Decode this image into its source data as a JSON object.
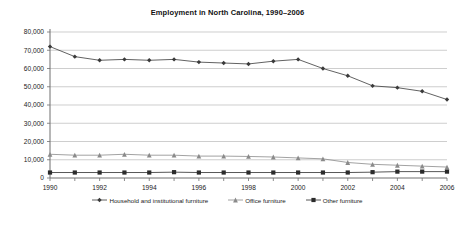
{
  "chart_data": {
    "type": "line",
    "title": "Employment in North Carolina, 1990–2006",
    "xlabel": "",
    "ylabel": "",
    "x": [
      1990,
      1991,
      1992,
      1993,
      1994,
      1995,
      1996,
      1997,
      1998,
      1999,
      2000,
      2001,
      2002,
      2003,
      2004,
      2005,
      2006
    ],
    "tick_labels_x": [
      "1990",
      "1992",
      "1994",
      "1996",
      "1998",
      "2000",
      "2002",
      "2004",
      "2006"
    ],
    "tick_values_x": [
      1990,
      1992,
      1994,
      1996,
      1998,
      2000,
      2002,
      2004,
      2006
    ],
    "tick_labels_y": [
      "0",
      "10,000",
      "20,000",
      "30,000",
      "40,000",
      "50,000",
      "60,000",
      "70,000",
      "80,000"
    ],
    "tick_values_y": [
      0,
      10000,
      20000,
      30000,
      40000,
      50000,
      60000,
      70000,
      80000
    ],
    "ylim": [
      0,
      80000
    ],
    "xlim": [
      1990,
      2006
    ],
    "grid": true,
    "grid_axis": "y",
    "legend_position": "bottom",
    "series": [
      {
        "name": "Household and institutional furniture",
        "marker": "diamond",
        "color": "#3a3a3a",
        "values": [
          72000,
          66500,
          64500,
          65000,
          64500,
          65000,
          63500,
          63000,
          62500,
          64000,
          65000,
          60000,
          56000,
          50500,
          49500,
          47500,
          43000
        ]
      },
      {
        "name": "Office furniture",
        "marker": "triangle",
        "color": "#8a8a8a",
        "values": [
          13000,
          12500,
          12500,
          13000,
          12500,
          12500,
          12000,
          12000,
          11800,
          11500,
          11000,
          10500,
          8500,
          7500,
          7000,
          6500,
          6000
        ]
      },
      {
        "name": "Other furniture",
        "marker": "square",
        "color": "#2b2b2b",
        "values": [
          3000,
          3000,
          3000,
          3000,
          3000,
          3200,
          3000,
          3000,
          3000,
          3000,
          3000,
          3000,
          3000,
          3200,
          3500,
          3500,
          3500
        ]
      }
    ]
  },
  "legend": {
    "items": [
      {
        "label": "Household and institutional furniture"
      },
      {
        "label": "Office furniture"
      },
      {
        "label": "Other furniture"
      }
    ]
  }
}
